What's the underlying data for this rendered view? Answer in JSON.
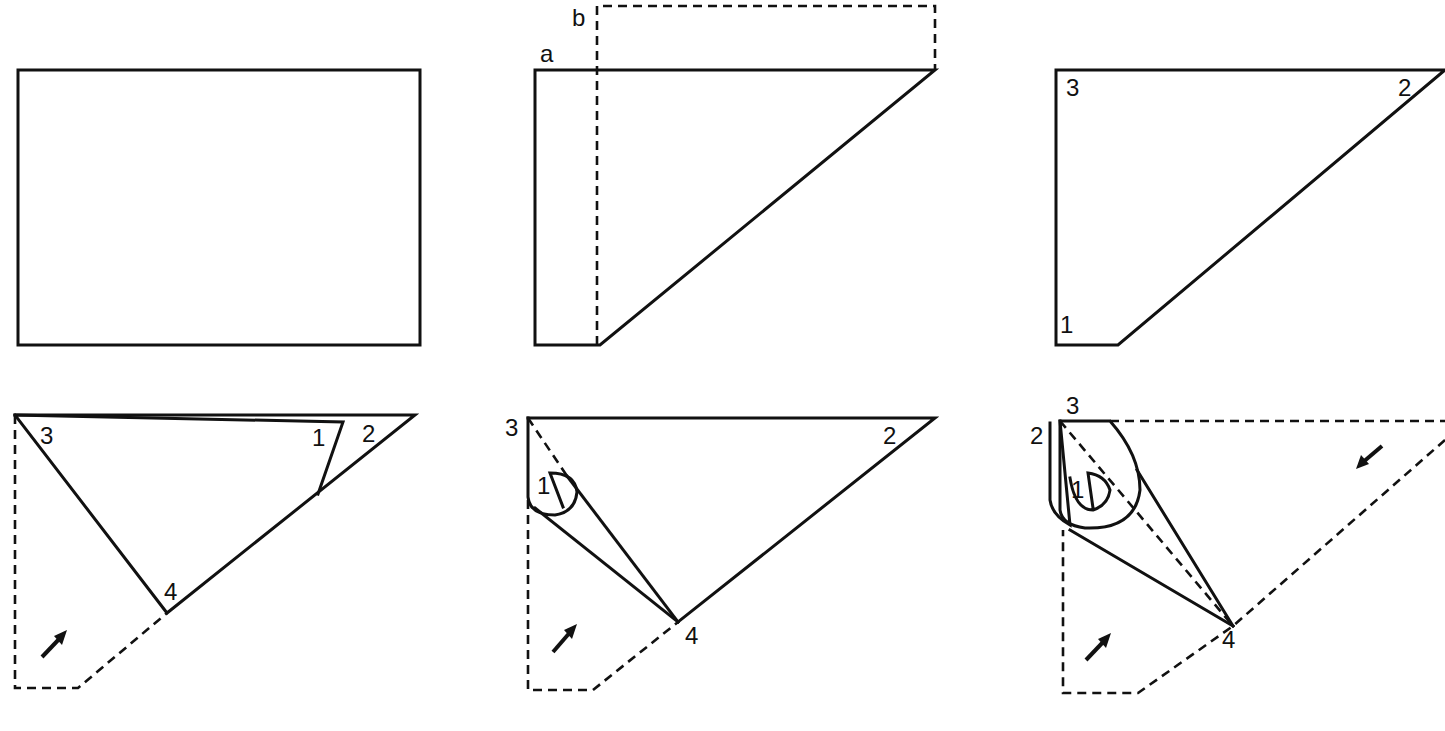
{
  "figure": {
    "panels": [
      {
        "id": "step1",
        "labels": []
      },
      {
        "id": "step2",
        "labels": [
          "a",
          "b"
        ]
      },
      {
        "id": "step3",
        "labels": [
          "3",
          "2",
          "1"
        ]
      },
      {
        "id": "step4",
        "labels": [
          "3",
          "1",
          "2",
          "4"
        ]
      },
      {
        "id": "step5",
        "labels": [
          "3",
          "2",
          "1",
          "4"
        ]
      },
      {
        "id": "step6",
        "labels": [
          "3",
          "2",
          "1",
          "4"
        ]
      }
    ],
    "colors": {
      "ink": "#111111",
      "background": "#ffffff"
    }
  },
  "labels": {
    "p2_a": "a",
    "p2_b": "b",
    "p3_3": "3",
    "p3_2": "2",
    "p3_1": "1",
    "p4_3": "3",
    "p4_1": "1",
    "p4_2": "2",
    "p4_4": "4",
    "p5_3": "3",
    "p5_2": "2",
    "p5_1": "1",
    "p5_4": "4",
    "p6_3": "3",
    "p6_2": "2",
    "p6_1": "1",
    "p6_4": "4"
  },
  "caption": ""
}
